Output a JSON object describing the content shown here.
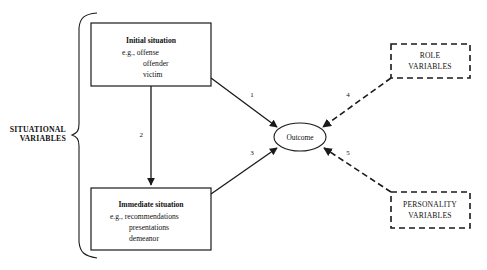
{
  "diagram": {
    "group_bracket": {
      "label_line1": "SITUATIONAL",
      "label_line2": "VARIABLES"
    },
    "nodes": {
      "initial_situation": {
        "title": "Initial situation",
        "example_prefix": "e.g.,",
        "items": [
          "offense",
          "offender",
          "victim"
        ],
        "line1": "e.g.,  offense",
        "line2": "offender",
        "line3": "victim"
      },
      "immediate_situation": {
        "title": "Immediate situation",
        "example_prefix": "e.g.,",
        "items": [
          "recommendations",
          "presentations",
          "demeanor"
        ],
        "line1": "e.g., recommendations",
        "line2": "presentations",
        "line3": "demeanor"
      },
      "outcome": {
        "label": "Outcome"
      },
      "role_variables": {
        "line1": "ROLE",
        "line2": "VARIABLES"
      },
      "personality_variables": {
        "line1": "PERSONALITY",
        "line2": "VARIABLES"
      }
    },
    "edges": [
      {
        "id": "edge-1",
        "label": "1",
        "style": "solid",
        "from": "initial_situation",
        "to": "outcome"
      },
      {
        "id": "edge-2",
        "label": "2",
        "style": "solid",
        "from": "initial_situation",
        "to": "immediate_situation"
      },
      {
        "id": "edge-3",
        "label": "3",
        "style": "solid",
        "from": "immediate_situation",
        "to": "outcome"
      },
      {
        "id": "edge-4",
        "label": "4",
        "style": "dashed",
        "from": "role_variables",
        "to": "outcome"
      },
      {
        "id": "edge-5",
        "label": "5",
        "style": "dashed",
        "from": "personality_variables",
        "to": "outcome"
      }
    ],
    "colors": {
      "stroke": "#1a1a1a",
      "text": "#111111",
      "background": "#ffffff"
    }
  }
}
